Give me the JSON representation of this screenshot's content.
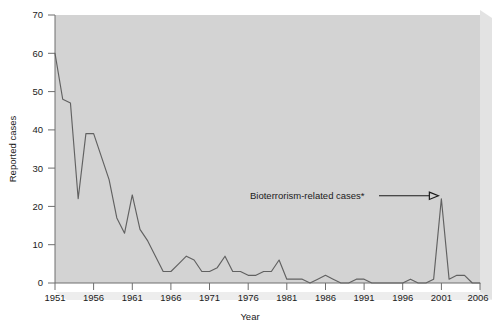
{
  "chart_data": {
    "type": "line",
    "title": "",
    "xlabel": "Year",
    "ylabel": "Reported cases",
    "xlim": [
      1951,
      2006
    ],
    "ylim": [
      0,
      70
    ],
    "xticks": [
      1951,
      1956,
      1961,
      1966,
      1971,
      1976,
      1981,
      1986,
      1991,
      1996,
      2001,
      2006
    ],
    "yticks": [
      0,
      10,
      20,
      30,
      40,
      50,
      60,
      70
    ],
    "grid": false,
    "legend": "none",
    "series_name": "Reported cases",
    "line_color": "#616161",
    "plot_background": "#d3d3d3",
    "x": [
      1951,
      1952,
      1953,
      1954,
      1955,
      1956,
      1957,
      1958,
      1959,
      1960,
      1961,
      1962,
      1963,
      1964,
      1965,
      1966,
      1967,
      1968,
      1969,
      1970,
      1971,
      1972,
      1973,
      1974,
      1975,
      1976,
      1977,
      1978,
      1979,
      1980,
      1981,
      1982,
      1983,
      1984,
      1985,
      1986,
      1987,
      1988,
      1989,
      1990,
      1991,
      1992,
      1993,
      1994,
      1995,
      1996,
      1997,
      1998,
      1999,
      2000,
      2001,
      2002,
      2003,
      2004,
      2005,
      2006
    ],
    "values": [
      60,
      48,
      47,
      22,
      39,
      39,
      33,
      27,
      17,
      13,
      23,
      14,
      11,
      7,
      3,
      3,
      5,
      7,
      6,
      3,
      3,
      4,
      7,
      3,
      3,
      2,
      2,
      3,
      3,
      6,
      1,
      1,
      1,
      0,
      1,
      2,
      1,
      0,
      0,
      1,
      1,
      0,
      0,
      0,
      0,
      0,
      1,
      0,
      0,
      1,
      22,
      1,
      2,
      2,
      0,
      0
    ],
    "annotations": [
      {
        "text": "Bioterrorism-related cases*",
        "target_x": 2001,
        "target_y": 22,
        "arrow": "right"
      }
    ]
  },
  "axis": {
    "y_title": "Reported cases",
    "x_title": "Year",
    "y_tick_labels": [
      "0",
      "10",
      "20",
      "30",
      "40",
      "50",
      "60",
      "70"
    ],
    "x_tick_labels": [
      "1951",
      "1956",
      "1961",
      "1966",
      "1971",
      "1976",
      "1981",
      "1986",
      "1991",
      "1996",
      "2001",
      "2006"
    ]
  },
  "annotation": {
    "label": "Bioterrorism-related cases*"
  }
}
